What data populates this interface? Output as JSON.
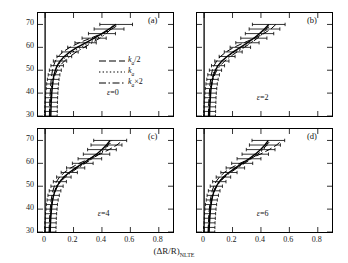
{
  "figure": {
    "ylabel": "切线高/km",
    "xlabel_main": "(ΔR/R)",
    "xlabel_sub": "NLTE"
  },
  "axes": {
    "ylim": [
      30,
      75
    ],
    "yticks": [
      30,
      40,
      50,
      60,
      70
    ],
    "ytick_labels": [
      "30",
      "40",
      "50",
      "60",
      "70"
    ],
    "xlim": [
      -0.05,
      0.9
    ],
    "xticks": [
      0,
      0.2,
      0.4,
      0.6,
      0.8
    ],
    "xtick_labels": [
      "0",
      "0.2",
      "0.4",
      "0.6",
      "0.8"
    ]
  },
  "legend": {
    "position": "panel-a-inner-right",
    "entries": [
      {
        "style": "dashed",
        "label_main": "k",
        "label_sub": "a",
        "label_tail": "/2"
      },
      {
        "style": "dotted",
        "label_main": "k",
        "label_sub": "a",
        "label_tail": ""
      },
      {
        "style": "dashdot",
        "label_main": "k",
        "label_sub": "a",
        "label_tail": "×2"
      }
    ],
    "eps_note": "ε=0"
  },
  "panels": [
    {
      "id": "a",
      "label": "(a)",
      "eps": "ε=0"
    },
    {
      "id": "b",
      "label": "(b)",
      "eps": "ε=2"
    },
    {
      "id": "c",
      "label": "(c)",
      "eps": "ε=4"
    },
    {
      "id": "d",
      "label": "(d)",
      "eps": "ε=6"
    }
  ],
  "chart_data": {
    "type": "line",
    "title": "",
    "xlabel": "(ΔR/R)_NLTE",
    "ylabel": "切线高/km",
    "xlim": [
      -0.05,
      0.9
    ],
    "ylim": [
      30,
      75
    ],
    "grid": false,
    "legend_position": "inside-panel-a",
    "shared_y": [
      30,
      32,
      34,
      36,
      38,
      40,
      42,
      44,
      46,
      48,
      50,
      52,
      54,
      56,
      58,
      60,
      62,
      64,
      66,
      68,
      70
    ],
    "panels": [
      {
        "id": "a",
        "eps": 0,
        "series": [
          {
            "name": "k_a/2",
            "style": "dashed",
            "values": [
              0.03,
              0.031,
              0.032,
              0.033,
              0.034,
              0.036,
              0.038,
              0.04,
              0.043,
              0.047,
              0.052,
              0.06,
              0.072,
              0.092,
              0.125,
              0.175,
              0.24,
              0.32,
              0.4,
              0.47,
              0.52
            ]
          },
          {
            "name": "k_a",
            "style": "dotted",
            "values": [
              0.032,
              0.033,
              0.034,
              0.036,
              0.038,
              0.04,
              0.043,
              0.047,
              0.052,
              0.06,
              0.072,
              0.09,
              0.115,
              0.15,
              0.195,
              0.25,
              0.31,
              0.37,
              0.42,
              0.46,
              0.48
            ]
          },
          {
            "name": "k_a×2",
            "style": "dashdot",
            "values": [
              0.034,
              0.035,
              0.037,
              0.039,
              0.041,
              0.044,
              0.048,
              0.053,
              0.06,
              0.07,
              0.085,
              0.105,
              0.135,
              0.175,
              0.22,
              0.275,
              0.33,
              0.385,
              0.43,
              0.465,
              0.49
            ]
          },
          {
            "name": "retrieved",
            "style": "solid-errorbar",
            "values": [
              0.04,
              0.041,
              0.042,
              0.043,
              0.045,
              0.047,
              0.05,
              0.053,
              0.057,
              0.063,
              0.072,
              0.085,
              0.105,
              0.135,
              0.175,
              0.225,
              0.285,
              0.345,
              0.4,
              0.45,
              0.5
            ],
            "xerr": [
              0.045,
              0.045,
              0.044,
              0.044,
              0.043,
              0.043,
              0.042,
              0.042,
              0.041,
              0.041,
              0.042,
              0.044,
              0.047,
              0.052,
              0.058,
              0.066,
              0.075,
              0.085,
              0.095,
              0.105,
              0.115
            ]
          }
        ]
      },
      {
        "id": "b",
        "eps": 2,
        "series": [
          {
            "name": "k_a/2",
            "style": "dashed",
            "values": [
              0.03,
              0.031,
              0.032,
              0.033,
              0.035,
              0.037,
              0.039,
              0.042,
              0.046,
              0.051,
              0.058,
              0.07,
              0.088,
              0.115,
              0.155,
              0.21,
              0.28,
              0.355,
              0.42,
              0.47,
              0.505
            ]
          },
          {
            "name": "k_a",
            "style": "dotted",
            "values": [
              0.032,
              0.033,
              0.034,
              0.036,
              0.038,
              0.041,
              0.044,
              0.048,
              0.054,
              0.062,
              0.075,
              0.095,
              0.125,
              0.165,
              0.215,
              0.27,
              0.325,
              0.375,
              0.415,
              0.445,
              0.465
            ]
          },
          {
            "name": "k_a×2",
            "style": "dashdot",
            "values": [
              0.034,
              0.035,
              0.037,
              0.039,
              0.042,
              0.045,
              0.049,
              0.055,
              0.063,
              0.074,
              0.09,
              0.113,
              0.145,
              0.185,
              0.232,
              0.283,
              0.332,
              0.375,
              0.41,
              0.438,
              0.458
            ]
          },
          {
            "name": "retrieved",
            "style": "solid-errorbar",
            "values": [
              0.038,
              0.039,
              0.04,
              0.042,
              0.044,
              0.046,
              0.049,
              0.053,
              0.059,
              0.067,
              0.08,
              0.098,
              0.125,
              0.162,
              0.205,
              0.255,
              0.305,
              0.35,
              0.39,
              0.425,
              0.455
            ],
            "xerr": [
              0.042,
              0.042,
              0.041,
              0.041,
              0.04,
              0.04,
              0.04,
              0.04,
              0.04,
              0.041,
              0.043,
              0.046,
              0.05,
              0.056,
              0.063,
              0.072,
              0.082,
              0.092,
              0.1,
              0.108,
              0.115
            ]
          }
        ]
      },
      {
        "id": "c",
        "eps": 4,
        "series": [
          {
            "name": "k_a/2",
            "style": "dashed",
            "values": [
              0.028,
              0.029,
              0.03,
              0.032,
              0.034,
              0.036,
              0.039,
              0.043,
              0.048,
              0.055,
              0.065,
              0.08,
              0.102,
              0.135,
              0.18,
              0.24,
              0.31,
              0.385,
              0.45,
              0.505,
              0.545
            ]
          },
          {
            "name": "k_a",
            "style": "dotted",
            "values": [
              0.03,
              0.031,
              0.033,
              0.035,
              0.037,
              0.04,
              0.044,
              0.049,
              0.056,
              0.066,
              0.08,
              0.1,
              0.13,
              0.17,
              0.22,
              0.275,
              0.33,
              0.38,
              0.42,
              0.45,
              0.47
            ]
          },
          {
            "name": "k_a×2",
            "style": "dashdot",
            "values": [
              0.032,
              0.033,
              0.035,
              0.037,
              0.04,
              0.043,
              0.047,
              0.053,
              0.061,
              0.072,
              0.088,
              0.11,
              0.142,
              0.183,
              0.23,
              0.282,
              0.332,
              0.378,
              0.415,
              0.443,
              0.462
            ]
          },
          {
            "name": "retrieved",
            "style": "solid-errorbar",
            "values": [
              0.036,
              0.037,
              0.038,
              0.04,
              0.042,
              0.045,
              0.048,
              0.053,
              0.06,
              0.07,
              0.084,
              0.104,
              0.132,
              0.17,
              0.215,
              0.265,
              0.315,
              0.362,
              0.4,
              0.432,
              0.458
            ],
            "xerr": [
              0.04,
              0.04,
              0.04,
              0.039,
              0.039,
              0.039,
              0.039,
              0.039,
              0.04,
              0.041,
              0.043,
              0.046,
              0.051,
              0.057,
              0.064,
              0.073,
              0.083,
              0.093,
              0.101,
              0.109,
              0.116
            ]
          }
        ]
      },
      {
        "id": "d",
        "eps": 6,
        "series": [
          {
            "name": "k_a/2",
            "style": "dashed",
            "values": [
              0.028,
              0.029,
              0.031,
              0.032,
              0.034,
              0.037,
              0.04,
              0.044,
              0.05,
              0.057,
              0.068,
              0.084,
              0.108,
              0.142,
              0.19,
              0.252,
              0.322,
              0.395,
              0.458,
              0.51,
              0.548
            ]
          },
          {
            "name": "k_a",
            "style": "dotted",
            "values": [
              0.03,
              0.031,
              0.033,
              0.035,
              0.038,
              0.041,
              0.045,
              0.05,
              0.058,
              0.068,
              0.083,
              0.104,
              0.134,
              0.174,
              0.224,
              0.278,
              0.33,
              0.378,
              0.416,
              0.445,
              0.465
            ]
          },
          {
            "name": "k_a×2",
            "style": "dashdot",
            "values": [
              0.032,
              0.033,
              0.035,
              0.038,
              0.04,
              0.044,
              0.048,
              0.054,
              0.062,
              0.074,
              0.09,
              0.113,
              0.145,
              0.186,
              0.233,
              0.284,
              0.333,
              0.377,
              0.413,
              0.44,
              0.46
            ]
          },
          {
            "name": "retrieved",
            "style": "solid-errorbar",
            "values": [
              0.035,
              0.036,
              0.038,
              0.04,
              0.042,
              0.045,
              0.049,
              0.054,
              0.061,
              0.071,
              0.086,
              0.107,
              0.136,
              0.175,
              0.22,
              0.268,
              0.316,
              0.36,
              0.398,
              0.428,
              0.452
            ],
            "xerr": [
              0.04,
              0.04,
              0.039,
              0.039,
              0.039,
              0.039,
              0.039,
              0.039,
              0.04,
              0.041,
              0.043,
              0.047,
              0.051,
              0.057,
              0.065,
              0.074,
              0.084,
              0.093,
              0.101,
              0.109,
              0.115
            ]
          }
        ]
      }
    ]
  }
}
